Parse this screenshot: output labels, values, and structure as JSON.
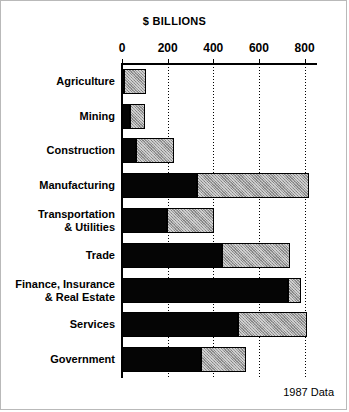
{
  "chart_data": {
    "type": "bar",
    "orientation": "horizontal",
    "stacked": true,
    "title": "$ BILLIONS",
    "xlabel": "$ BILLIONS",
    "ylabel": "",
    "xlim": [
      0,
      850
    ],
    "xticks": [
      0,
      200,
      400,
      600,
      800
    ],
    "xtick_labels": [
      "0",
      "200",
      "400",
      "600",
      "800"
    ],
    "grid": true,
    "grid_axis": "x",
    "legend": "none",
    "annotation": "1987 Data",
    "categories": [
      "Agriculture",
      "Mining",
      "Construction",
      "Manufacturing",
      "Transportation & Utilities",
      "Trade",
      "Finance, Insurance & Real Estate",
      "Services",
      "Government"
    ],
    "series": [
      {
        "name": "dark-segment",
        "color": "#050505",
        "values": [
          8,
          37,
          62,
          330,
          195,
          440,
          728,
          510,
          345
        ]
      },
      {
        "name": "light-segment",
        "color": "#9d9d9d",
        "values": [
          97,
          63,
          168,
          490,
          210,
          295,
          57,
          300,
          200
        ]
      }
    ],
    "totals": [
      105,
      100,
      230,
      820,
      405,
      735,
      785,
      810,
      545
    ]
  },
  "chart": {
    "title": "$ BILLIONS",
    "annotation": "1987 Data",
    "axis": {
      "tick_labels": [
        "0",
        "200",
        "400",
        "600",
        "800"
      ],
      "tick_values": [
        0,
        200,
        400,
        600,
        800
      ],
      "max": 850
    },
    "rows": [
      {
        "label": "Agriculture",
        "label_line1": "Agriculture",
        "label_line2": "",
        "dark": 8,
        "light": 97,
        "total": 105
      },
      {
        "label": "Mining",
        "label_line1": "Mining",
        "label_line2": "",
        "dark": 37,
        "light": 63,
        "total": 100
      },
      {
        "label": "Construction",
        "label_line1": "Construction",
        "label_line2": "",
        "dark": 62,
        "light": 168,
        "total": 230
      },
      {
        "label": "Manufacturing",
        "label_line1": "Manufacturing",
        "label_line2": "",
        "dark": 330,
        "light": 490,
        "total": 820
      },
      {
        "label": "Transportation & Utilities",
        "label_line1": "Transportation",
        "label_line2": "& Utilities",
        "dark": 195,
        "light": 210,
        "total": 405
      },
      {
        "label": "Trade",
        "label_line1": "Trade",
        "label_line2": "",
        "dark": 440,
        "light": 295,
        "total": 735
      },
      {
        "label": "Finance, Insurance & Real Estate",
        "label_line1": "Finance, Insurance",
        "label_line2": "& Real Estate",
        "dark": 728,
        "light": 57,
        "total": 785
      },
      {
        "label": "Services",
        "label_line1": "Services",
        "label_line2": "",
        "dark": 510,
        "light": 300,
        "total": 810
      },
      {
        "label": "Government",
        "label_line1": "Government",
        "label_line2": "",
        "dark": 345,
        "light": 200,
        "total": 545
      }
    ],
    "colors": {
      "dark_segment": "#050505",
      "light_segment": "#9d9d9d",
      "axis": "#000000",
      "background": "#ffffff"
    }
  }
}
